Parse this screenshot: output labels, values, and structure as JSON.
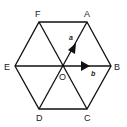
{
  "diagram": {
    "vertices": [
      {
        "id": "A",
        "label": "A",
        "x": 87,
        "y": 22
      },
      {
        "id": "B",
        "label": "B",
        "x": 111,
        "y": 66
      },
      {
        "id": "C",
        "label": "C",
        "x": 87,
        "y": 109
      },
      {
        "id": "D",
        "label": "D",
        "x": 39,
        "y": 109
      },
      {
        "id": "E",
        "label": "E",
        "x": 15,
        "y": 66
      },
      {
        "id": "F",
        "label": "F",
        "x": 39,
        "y": 22
      }
    ],
    "center": {
      "id": "O",
      "label": "O",
      "x": 63,
      "y": 66
    },
    "vectors": [
      {
        "name": "a",
        "label": "a",
        "from": "O",
        "to": "A"
      },
      {
        "name": "b",
        "label": "b",
        "from": "O",
        "to": "B"
      }
    ],
    "diagonals": [
      "AD",
      "BE",
      "CF"
    ],
    "colors": {
      "stroke": "#111111",
      "background": "#ffffff"
    }
  }
}
